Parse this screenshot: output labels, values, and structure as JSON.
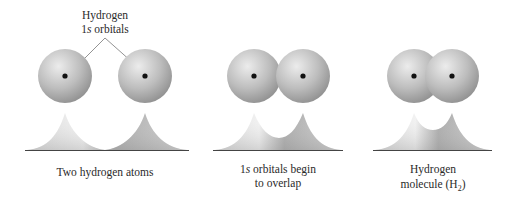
{
  "figure": {
    "top_label": {
      "line1": "Hydrogen",
      "line2_num": "1",
      "line2_italic": "s",
      "line2_rest": " orbitals"
    },
    "panels": [
      {
        "id": "separate",
        "caption_line1": "Two hydrogen atoms",
        "caption_line2": "",
        "nuclei_x": [
          65,
          145
        ],
        "sphere_radius": 27,
        "valley_height": 0
      },
      {
        "id": "overlap",
        "caption_line1_num": "1",
        "caption_line1_italic": "s",
        "caption_line1_rest": " orbitals begin",
        "caption_line2": "to overlap",
        "nuclei_x": [
          254,
          303
        ],
        "sphere_radius": 27,
        "valley_height": 12
      },
      {
        "id": "molecule",
        "caption_line1": "Hydrogen",
        "caption_line2_text": "molecule (H",
        "caption_line2_sub": "2",
        "caption_line2_end": ")",
        "nuclei_x": [
          414,
          452
        ],
        "sphere_radius": 27,
        "valley_height": 20
      }
    ],
    "colors": {
      "sphere_light": "#e6e6e6",
      "sphere_mid": "#b5b5b5",
      "sphere_dark": "#8a8a8a",
      "nucleus": "#111111",
      "leader_line": "#777777",
      "baseline": "#444444"
    }
  }
}
